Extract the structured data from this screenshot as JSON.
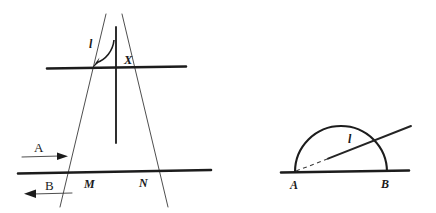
{
  "figure": {
    "background_color": "#ffffff",
    "ink_color": "#1c1c1c",
    "width": 436,
    "height": 213,
    "panels": [
      {
        "id": "left-panel",
        "name": "mirror-reflection-diagram",
        "labels": {
          "ray_label": "l",
          "point_x": "X",
          "point_m": "M",
          "point_n": "N",
          "direction_a": "A",
          "direction_b": "B"
        },
        "elements": {
          "upper_horizontal_line": "surface-line",
          "lower_horizontal_line": "base-line",
          "vertical_normal": "normal-line",
          "converging_line_left": "ray-through-m",
          "converging_line_right": "ray-through-n",
          "angle_arc": "angle-arrow",
          "arrow_a": "arrow-right",
          "arrow_b": "arrow-left"
        }
      },
      {
        "id": "right-panel",
        "name": "semicircle-diagram",
        "labels": {
          "ray_label": "l",
          "point_a": "A",
          "point_b": "B"
        },
        "elements": {
          "baseline": "diameter-line",
          "semicircle": "semicircle-arc",
          "ray_dashed": "ray-dashed-segment",
          "ray_solid": "ray-solid-segment"
        }
      }
    ]
  }
}
